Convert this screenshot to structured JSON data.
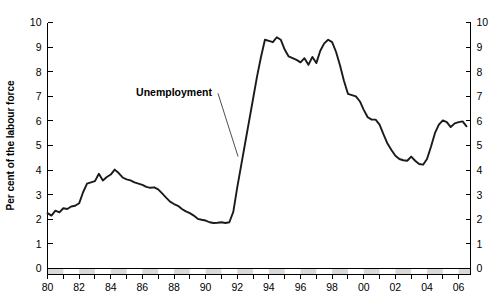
{
  "chart_data": {
    "type": "line",
    "title": "",
    "subtitle": "",
    "xlabel": "",
    "ylabel": "Per cent of the labour force",
    "ylim": [
      0,
      10
    ],
    "xlim": [
      1980.0,
      2006.75
    ],
    "grid": false,
    "legend_position": "inline-annotation",
    "annotations": [
      {
        "text": "Unemployment",
        "x": 1990.4,
        "y": 7.0
      }
    ],
    "y_ticks": [
      "0",
      "1",
      "2",
      "3",
      "4",
      "5",
      "6",
      "7",
      "8",
      "9",
      "10"
    ],
    "y_tick_values": [
      0,
      1,
      2,
      3,
      4,
      5,
      6,
      7,
      8,
      9,
      10
    ],
    "y_ticks_right": [
      "0",
      "1",
      "2",
      "3",
      "4",
      "5",
      "6",
      "7",
      "8",
      "9",
      "10"
    ],
    "x_ticks": [
      "80",
      "82",
      "84",
      "86",
      "88",
      "90",
      "92",
      "94",
      "96",
      "98",
      "00",
      "02",
      "04",
      "06"
    ],
    "x_tick_values": [
      1980,
      1982,
      1984,
      1986,
      1988,
      1990,
      1992,
      1994,
      1996,
      1998,
      2000,
      2002,
      2004,
      2006
    ],
    "x_minor_tick_values": [
      1981,
      1983,
      1985,
      1987,
      1989,
      1991,
      1993,
      1995,
      1997,
      1999,
      2001,
      2003,
      2005
    ],
    "series": [
      {
        "name": "Unemployment",
        "color": "#1a1a1a",
        "x": [
          1980.0,
          1980.25,
          1980.5,
          1980.75,
          1981.0,
          1981.25,
          1981.5,
          1981.75,
          1982.0,
          1982.25,
          1982.5,
          1982.75,
          1983.0,
          1983.25,
          1983.5,
          1983.75,
          1984.0,
          1984.25,
          1984.5,
          1984.75,
          1985.0,
          1985.25,
          1985.5,
          1985.75,
          1986.0,
          1986.25,
          1986.5,
          1986.75,
          1987.0,
          1987.25,
          1987.5,
          1987.75,
          1988.0,
          1988.25,
          1988.5,
          1988.75,
          1989.0,
          1989.25,
          1989.5,
          1989.75,
          1990.0,
          1990.25,
          1990.5,
          1990.75,
          1991.0,
          1991.25,
          1991.5,
          1991.75,
          1992.0,
          1992.25,
          1992.5,
          1992.75,
          1993.0,
          1993.25,
          1993.5,
          1993.75,
          1994.0,
          1994.25,
          1994.5,
          1994.75,
          1995.0,
          1995.25,
          1995.5,
          1995.75,
          1996.0,
          1996.25,
          1996.5,
          1996.75,
          1997.0,
          1997.25,
          1997.5,
          1997.75,
          1998.0,
          1998.25,
          1998.5,
          1998.75,
          1999.0,
          1999.25,
          1999.5,
          1999.75,
          2000.0,
          2000.25,
          2000.5,
          2000.75,
          2001.0,
          2001.25,
          2001.5,
          2001.75,
          2002.0,
          2002.25,
          2002.5,
          2002.75,
          2003.0,
          2003.25,
          2003.5,
          2003.75,
          2004.0,
          2004.25,
          2004.5,
          2004.75,
          2005.0,
          2005.25,
          2005.5,
          2005.75,
          2006.0,
          2006.25,
          2006.5
        ],
        "values": [
          2.25,
          2.15,
          2.35,
          2.28,
          2.45,
          2.42,
          2.52,
          2.55,
          2.65,
          3.1,
          3.45,
          3.5,
          3.55,
          3.85,
          3.58,
          3.72,
          3.82,
          4.02,
          3.88,
          3.7,
          3.62,
          3.58,
          3.5,
          3.45,
          3.4,
          3.32,
          3.28,
          3.3,
          3.22,
          3.05,
          2.88,
          2.72,
          2.62,
          2.55,
          2.42,
          2.32,
          2.25,
          2.15,
          2.02,
          1.98,
          1.95,
          1.88,
          1.85,
          1.86,
          1.88,
          1.85,
          1.88,
          2.3,
          3.3,
          4.2,
          5.1,
          6.0,
          6.9,
          7.8,
          8.6,
          9.3,
          9.25,
          9.2,
          9.4,
          9.3,
          8.9,
          8.62,
          8.55,
          8.48,
          8.38,
          8.55,
          8.28,
          8.6,
          8.35,
          8.85,
          9.15,
          9.3,
          9.2,
          8.8,
          8.25,
          7.62,
          7.1,
          7.05,
          7.0,
          6.8,
          6.45,
          6.15,
          6.05,
          6.05,
          5.85,
          5.45,
          5.08,
          4.82,
          4.58,
          4.45,
          4.4,
          4.38,
          4.55,
          4.38,
          4.25,
          4.22,
          4.45,
          4.95,
          5.5,
          5.85,
          6.02,
          5.95,
          5.75,
          5.9,
          5.95,
          5.98,
          5.78
        ]
      }
    ]
  }
}
